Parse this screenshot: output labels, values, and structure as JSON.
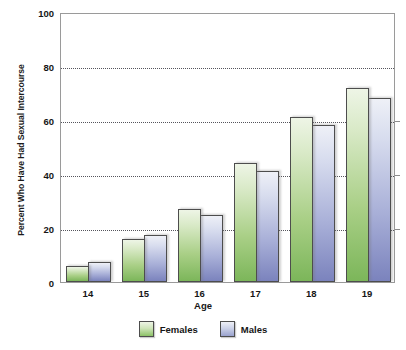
{
  "chart_data": {
    "type": "bar",
    "title": "",
    "xlabel": "Age",
    "ylabel": "Percent Who Have Had Sexual Intercourse",
    "categories": [
      "14",
      "15",
      "16",
      "17",
      "18",
      "19"
    ],
    "series": [
      {
        "name": "Females",
        "color": "#8cc267",
        "values": [
          6,
          16,
          27,
          44,
          61,
          72
        ]
      },
      {
        "name": "Males",
        "color": "#9aa2ce",
        "values": [
          7.5,
          17.5,
          25,
          41,
          58,
          68
        ]
      }
    ],
    "ylim": [
      0,
      100
    ],
    "yticks": [
      0,
      20,
      40,
      60,
      80,
      100
    ],
    "ytick_labels": [
      "0",
      "20",
      "40",
      "60",
      "80",
      "100"
    ],
    "grid": true,
    "grid_style": "dotted-horizontal",
    "legend_position": "bottom-center"
  },
  "legend": {
    "items": [
      {
        "label": "Females"
      },
      {
        "label": "Males"
      }
    ]
  },
  "axes": {
    "y_title": "Percent Who Have Had Sexual Intercourse",
    "x_title": "Age"
  }
}
